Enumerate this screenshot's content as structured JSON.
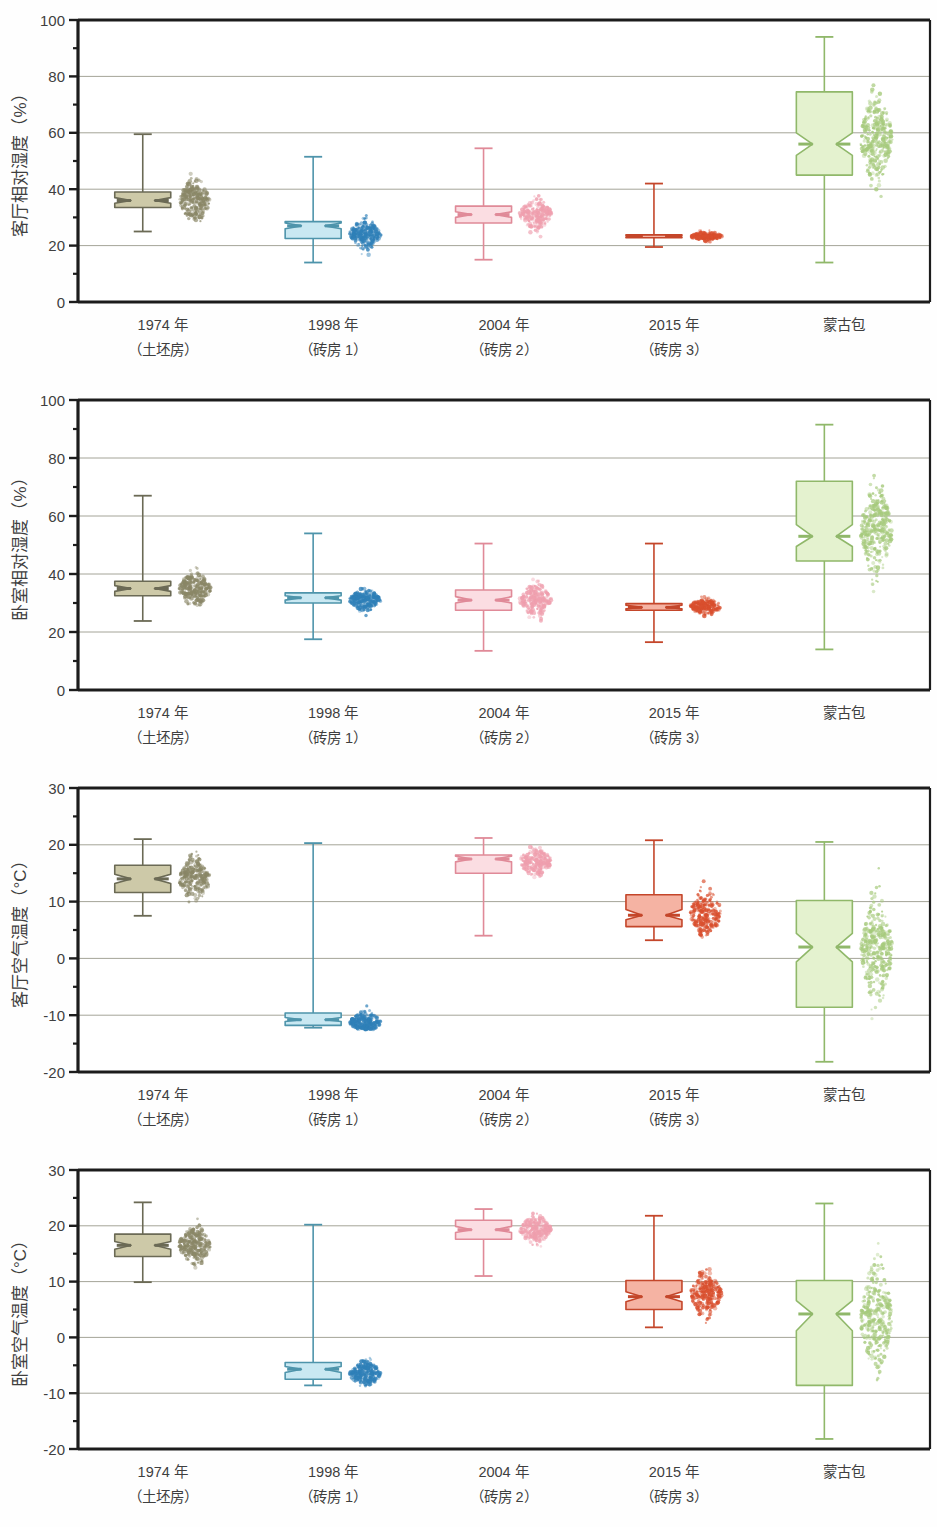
{
  "figure": {
    "background_color": "#fefefe",
    "categories": [
      {
        "line1": "1974 年",
        "line2": "（土坯房）"
      },
      {
        "line1": "1998 年",
        "line2": "（砖房 1）"
      },
      {
        "line1": "2004 年",
        "line2": "（砖房 2）"
      },
      {
        "line1": "2015 年",
        "line2": "（砖房 3）"
      },
      {
        "line1": "蒙古包",
        "line2": ""
      }
    ],
    "group_colors": {
      "1974": {
        "fill": "#cdc9a8",
        "stroke": "#6b6a55",
        "point": "#8a8767"
      },
      "1998": {
        "fill": "#c9e8f2",
        "stroke": "#4e94ab",
        "point": "#2f80b8"
      },
      "2004": {
        "fill": "#fbdde2",
        "stroke": "#e08a98",
        "point": "#ef9fae"
      },
      "2015": {
        "fill": "#f5b3a3",
        "stroke": "#c4462a",
        "point": "#d94f2e"
      },
      "yurt": {
        "fill": "#e4f2cf",
        "stroke": "#90b86a",
        "point": "#a6ca7c"
      }
    }
  },
  "chart_data": [
    {
      "type": "box",
      "panel_index": 0,
      "title": "",
      "xlabel": "",
      "ylabel": "客厅相对湿度（%）",
      "ylim": [
        0,
        100
      ],
      "yticks": [
        0,
        20,
        40,
        60,
        80,
        100
      ],
      "ytick_labels": [
        "0",
        "20",
        "40",
        "60",
        "80",
        "100"
      ],
      "minor_tick_step": 10,
      "grid": true,
      "categories": [
        "1974 年（土坯房）",
        "1998 年（砖房 1）",
        "2004 年（砖房 2）",
        "2015 年（砖房 3）",
        "蒙古包"
      ],
      "boxes": [
        {
          "group": "1974",
          "min": 25.0,
          "q1": 33.5,
          "median": 36.0,
          "q3": 39.0,
          "max": 59.5,
          "notch_low": 35.0,
          "notch_high": 37.0,
          "point_mean": 36.0,
          "point_spread": 6.5,
          "point_low": 28.5,
          "point_high": 54.0,
          "n": 260
        },
        {
          "group": "1998",
          "min": 14.0,
          "q1": 22.5,
          "median": 27.0,
          "q3": 28.5,
          "max": 51.5,
          "notch_low": 26.0,
          "notch_high": 28.0,
          "point_mean": 24.0,
          "point_spread": 4.5,
          "point_low": 16.5,
          "point_high": 31.0,
          "n": 240
        },
        {
          "group": "2004",
          "min": 15.0,
          "q1": 28.0,
          "median": 31.0,
          "q3": 34.0,
          "max": 54.5,
          "notch_low": 30.0,
          "notch_high": 32.0,
          "point_mean": 31.0,
          "point_spread": 5.0,
          "point_low": 22.0,
          "point_high": 43.0,
          "n": 220
        },
        {
          "group": "2015",
          "min": 19.5,
          "q1": 22.8,
          "median": 23.3,
          "q3": 23.8,
          "max": 42.0,
          "notch_low": 23.0,
          "notch_high": 23.6,
          "point_mean": 23.3,
          "point_spread": 1.4,
          "point_low": 20.5,
          "point_high": 26.5,
          "n": 180
        },
        {
          "group": "yurt",
          "min": 14.0,
          "q1": 45.0,
          "median": 56.0,
          "q3": 74.5,
          "max": 94.0,
          "notch_low": 52.0,
          "notch_high": 60.0,
          "point_mean": 58.0,
          "point_spread": 14.0,
          "point_low": 22.0,
          "point_high": 88.0,
          "n": 320
        }
      ]
    },
    {
      "type": "box",
      "panel_index": 1,
      "title": "",
      "xlabel": "",
      "ylabel": "卧室相对湿度（%）",
      "ylim": [
        0,
        100
      ],
      "yticks": [
        0,
        20,
        40,
        60,
        80,
        100
      ],
      "ytick_labels": [
        "0",
        "20",
        "40",
        "60",
        "80",
        "100"
      ],
      "minor_tick_step": 10,
      "grid": true,
      "categories": [
        "1974 年（土坯房）",
        "1998 年（砖房 1）",
        "2004 年（砖房 2）",
        "2015 年（砖房 3）",
        "蒙古包"
      ],
      "boxes": [
        {
          "group": "1974",
          "min": 23.8,
          "q1": 32.5,
          "median": 35.0,
          "q3": 37.5,
          "max": 67.0,
          "notch_low": 34.0,
          "notch_high": 36.0,
          "point_mean": 35.0,
          "point_spread": 5.0,
          "point_low": 29.0,
          "point_high": 56.0,
          "n": 260
        },
        {
          "group": "1998",
          "min": 17.5,
          "q1": 30.0,
          "median": 31.8,
          "q3": 33.5,
          "max": 54.0,
          "notch_low": 31.0,
          "notch_high": 32.5,
          "point_mean": 31.0,
          "point_spread": 3.2,
          "point_low": 24.0,
          "point_high": 35.5,
          "n": 240
        },
        {
          "group": "2004",
          "min": 13.5,
          "q1": 27.5,
          "median": 31.0,
          "q3": 34.5,
          "max": 50.5,
          "notch_low": 30.0,
          "notch_high": 32.2,
          "point_mean": 31.0,
          "point_spread": 5.0,
          "point_low": 22.0,
          "point_high": 42.0,
          "n": 220
        },
        {
          "group": "2015",
          "min": 16.5,
          "q1": 27.5,
          "median": 28.5,
          "q3": 29.8,
          "max": 50.5,
          "notch_low": 28.0,
          "notch_high": 29.2,
          "point_mean": 28.8,
          "point_spread": 2.5,
          "point_low": 23.0,
          "point_high": 34.5,
          "n": 200
        },
        {
          "group": "yurt",
          "min": 14.0,
          "q1": 44.5,
          "median": 53.0,
          "q3": 72.0,
          "max": 91.5,
          "notch_low": 49.5,
          "notch_high": 57.0,
          "point_mean": 55.0,
          "point_spread": 13.5,
          "point_low": 22.0,
          "point_high": 85.0,
          "n": 320
        }
      ]
    },
    {
      "type": "box",
      "panel_index": 2,
      "title": "",
      "xlabel": "",
      "ylabel": "客厅空气温度（°C）",
      "ylim": [
        -20,
        30
      ],
      "yticks": [
        -20,
        -10,
        0,
        10,
        20,
        30
      ],
      "ytick_labels": [
        "-20",
        "-10",
        "0",
        "10",
        "20",
        "30"
      ],
      "minor_tick_step": 5,
      "grid": true,
      "categories": [
        "1974 年（土坯房）",
        "1998 年（砖房 1）",
        "2004 年（砖房 2）",
        "2015 年（砖房 3）",
        "蒙古包"
      ],
      "boxes": [
        {
          "group": "1974",
          "min": 7.5,
          "q1": 11.6,
          "median": 14.0,
          "q3": 16.4,
          "max": 21.0,
          "notch_low": 13.2,
          "notch_high": 14.8,
          "point_mean": 14.0,
          "point_spread": 3.2,
          "point_low": 8.0,
          "point_high": 20.5,
          "n": 260
        },
        {
          "group": "1998",
          "min": -12.2,
          "q1": -11.8,
          "median": -10.8,
          "q3": -9.6,
          "max": 20.3,
          "notch_low": -11.1,
          "notch_high": -10.4,
          "point_mean": -11.3,
          "point_spread": 1.6,
          "point_low": -12.5,
          "point_high": -5.5,
          "n": 240
        },
        {
          "group": "2004",
          "min": 4.0,
          "q1": 15.0,
          "median": 17.5,
          "q3": 18.2,
          "max": 21.2,
          "notch_low": 17.0,
          "notch_high": 18.0,
          "point_mean": 17.0,
          "point_spread": 2.3,
          "point_low": 11.5,
          "point_high": 21.0,
          "n": 220
        },
        {
          "group": "2015",
          "min": 3.2,
          "q1": 5.6,
          "median": 7.6,
          "q3": 11.2,
          "max": 20.8,
          "notch_low": 6.8,
          "notch_high": 8.6,
          "point_mean": 8.0,
          "point_spread": 3.6,
          "point_low": 3.5,
          "point_high": 19.5,
          "n": 240
        },
        {
          "group": "yurt",
          "min": -18.2,
          "q1": -8.6,
          "median": 2.0,
          "q3": 10.2,
          "max": 20.5,
          "notch_low": -0.6,
          "notch_high": 4.4,
          "point_mean": 1.5,
          "point_spread": 8.0,
          "point_low": -17.5,
          "point_high": 19.5,
          "n": 320
        }
      ]
    },
    {
      "type": "box",
      "panel_index": 3,
      "title": "",
      "xlabel": "",
      "ylabel": "卧室空气温度（°C）",
      "ylim": [
        -20,
        30
      ],
      "yticks": [
        -20,
        -10,
        0,
        10,
        20,
        30
      ],
      "ytick_labels": [
        "-20",
        "-10",
        "0",
        "10",
        "20",
        "30"
      ],
      "minor_tick_step": 5,
      "grid": true,
      "categories": [
        "1974 年（土坯房）",
        "1998 年（砖房 1）",
        "2004 年（砖房 2）",
        "2015 年（砖房 3）",
        "蒙古包"
      ],
      "boxes": [
        {
          "group": "1974",
          "min": 9.9,
          "q1": 14.5,
          "median": 16.5,
          "q3": 18.5,
          "max": 24.2,
          "notch_low": 15.8,
          "notch_high": 17.2,
          "point_mean": 16.5,
          "point_spread": 3.0,
          "point_low": 10.5,
          "point_high": 23.5,
          "n": 260
        },
        {
          "group": "1998",
          "min": -8.6,
          "q1": -7.5,
          "median": -5.7,
          "q3": -4.5,
          "max": 20.2,
          "notch_low": -6.3,
          "notch_high": -5.2,
          "point_mean": -6.5,
          "point_spread": 2.0,
          "point_low": -8.8,
          "point_high": 10.0,
          "n": 240
        },
        {
          "group": "2004",
          "min": 11.0,
          "q1": 17.6,
          "median": 19.3,
          "q3": 21.0,
          "max": 23.0,
          "notch_low": 18.8,
          "notch_high": 19.9,
          "point_mean": 19.3,
          "point_spread": 2.1,
          "point_low": 13.5,
          "point_high": 23.0,
          "n": 220
        },
        {
          "group": "2015",
          "min": 1.8,
          "q1": 5.0,
          "median": 7.3,
          "q3": 10.2,
          "max": 21.8,
          "notch_low": 6.4,
          "notch_high": 8.2,
          "point_mean": 7.8,
          "point_spread": 3.4,
          "point_low": 2.5,
          "point_high": 19.0,
          "n": 240
        },
        {
          "group": "yurt",
          "min": -18.2,
          "q1": -8.6,
          "median": 4.2,
          "q3": 10.2,
          "max": 24.0,
          "notch_low": 1.2,
          "notch_high": 6.6,
          "point_mean": 3.5,
          "point_spread": 8.5,
          "point_low": -17.5,
          "point_high": 22.5,
          "n": 320
        }
      ]
    }
  ]
}
